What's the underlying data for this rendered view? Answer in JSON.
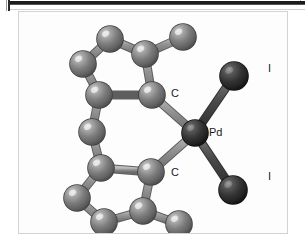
{
  "figure": {
    "caption_labels": {
      "carbon_top": "C",
      "carbon_bottom": "C",
      "palladium": "Pd",
      "iodine_top": "I",
      "iodine_bottom": "I"
    }
  },
  "colors": {
    "carbon_gray": "#767676",
    "carbon_gray_light": "#b9b9b9",
    "carbon_gray_dark": "#4e4e4e",
    "heavy_dark": "#3a3a3a",
    "heavy_dark_light": "#6e6e6e",
    "heavy_dark_shadow": "#141414",
    "bond_gray": "#8c8c8c",
    "bond_dark": "#3f3f3f",
    "frame_border": "#d2d2d2",
    "background": "#fdfdfd",
    "label_text": "#1a1a1a"
  },
  "chart_data": {
    "type": "scatter",
    "title": "",
    "xlabel": "",
    "ylabel": "",
    "atoms": [
      {
        "id": "Pd",
        "element": "Pd",
        "label": "Pd",
        "x": 176,
        "y": 121,
        "r": 13,
        "shade": "dark"
      },
      {
        "id": "I1",
        "element": "I",
        "label": "I",
        "x": 215,
        "y": 64,
        "r": 14,
        "shade": "dark"
      },
      {
        "id": "I2",
        "element": "I",
        "label": "I",
        "x": 214,
        "y": 178,
        "r": 14,
        "shade": "dark"
      },
      {
        "id": "C1",
        "element": "C",
        "label": "C",
        "x": 133,
        "y": 83,
        "r": 13,
        "shade": "gray"
      },
      {
        "id": "C2",
        "element": "C",
        "label": "C",
        "x": 132,
        "y": 160,
        "r": 13,
        "shade": "gray"
      },
      {
        "id": "C3",
        "element": "C",
        "x": 126,
        "y": 42,
        "r": 13,
        "shade": "gray"
      },
      {
        "id": "C4",
        "element": "C",
        "x": 91,
        "y": 27,
        "r": 13,
        "shade": "gray"
      },
      {
        "id": "C5",
        "element": "C",
        "x": 64,
        "y": 52,
        "r": 13,
        "shade": "gray"
      },
      {
        "id": "C6",
        "element": "C",
        "x": 80,
        "y": 83,
        "r": 13,
        "shade": "gray"
      },
      {
        "id": "C7",
        "element": "C",
        "x": 164,
        "y": 25,
        "r": 13,
        "shade": "gray"
      },
      {
        "id": "C8",
        "element": "C",
        "x": 73,
        "y": 120,
        "r": 13,
        "shade": "gray"
      },
      {
        "id": "C9",
        "element": "C",
        "x": 82,
        "y": 156,
        "r": 13,
        "shade": "gray"
      },
      {
        "id": "C10",
        "element": "C",
        "x": 58,
        "y": 186,
        "r": 13,
        "shade": "gray"
      },
      {
        "id": "C11",
        "element": "C",
        "x": 85,
        "y": 210,
        "r": 13,
        "shade": "gray"
      },
      {
        "id": "C12",
        "element": "C",
        "x": 124,
        "y": 199,
        "r": 13,
        "shade": "gray"
      },
      {
        "id": "C13",
        "element": "C",
        "x": 160,
        "y": 212,
        "r": 13,
        "shade": "gray"
      }
    ],
    "bonds": [
      {
        "from": "Pd",
        "to": "I1",
        "style": "dark"
      },
      {
        "from": "Pd",
        "to": "I2",
        "style": "dark"
      },
      {
        "from": "Pd",
        "to": "C1",
        "style": "gray"
      },
      {
        "from": "Pd",
        "to": "C2",
        "style": "gray"
      },
      {
        "from": "C1",
        "to": "C3",
        "style": "gray"
      },
      {
        "from": "C1",
        "to": "C6",
        "style": "gray"
      },
      {
        "from": "C3",
        "to": "C4",
        "style": "gray"
      },
      {
        "from": "C3",
        "to": "C7",
        "style": "gray"
      },
      {
        "from": "C4",
        "to": "C5",
        "style": "gray"
      },
      {
        "from": "C5",
        "to": "C6",
        "style": "gray"
      },
      {
        "from": "C6",
        "to": "C8",
        "style": "gray"
      },
      {
        "from": "C8",
        "to": "C9",
        "style": "gray"
      },
      {
        "from": "C9",
        "to": "C2",
        "style": "gray"
      },
      {
        "from": "C9",
        "to": "C10",
        "style": "gray"
      },
      {
        "from": "C10",
        "to": "C11",
        "style": "gray"
      },
      {
        "from": "C11",
        "to": "C12",
        "style": "gray"
      },
      {
        "from": "C12",
        "to": "C2",
        "style": "gray"
      },
      {
        "from": "C12",
        "to": "C13",
        "style": "gray"
      }
    ],
    "labels": [
      {
        "text": "C",
        "x": 152,
        "y": 76,
        "for": "C1"
      },
      {
        "text": "C",
        "x": 152,
        "y": 155,
        "for": "C2"
      },
      {
        "text": "Pd",
        "x": 190,
        "y": 115,
        "for": "Pd"
      },
      {
        "text": "I",
        "x": 249,
        "y": 51,
        "for": "I1"
      },
      {
        "text": "I",
        "x": 249,
        "y": 159,
        "for": "I2"
      }
    ]
  }
}
